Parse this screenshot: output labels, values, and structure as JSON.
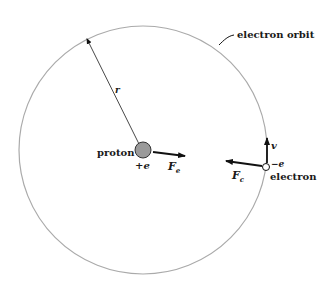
{
  "figure": {
    "labels": {
      "orbit": "electron orbit",
      "radius": "r",
      "proton": "proton",
      "proton_charge": "+e",
      "electric_force": "F",
      "electric_force_sub": "e",
      "electron": "electron",
      "electron_charge": "−e",
      "velocity": "v",
      "centripetal_force": "F",
      "centripetal_force_sub": "c"
    },
    "colors": {
      "orbit": "#aaaaaa",
      "proton_fill": "#9a9a9a",
      "arrow": "#111111",
      "text": "#1a1a1a",
      "background": "#ffffff"
    }
  }
}
